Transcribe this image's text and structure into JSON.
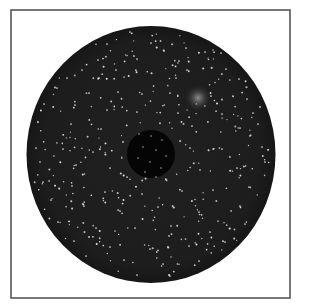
{
  "figure": {
    "width": 303,
    "height": 305,
    "background": "#ffffff",
    "frame": {
      "x": 11,
      "y": 10,
      "w": 279,
      "h": 288,
      "stroke": "#555555",
      "stroke_width": 1.6
    },
    "disc": {
      "cx": 151,
      "cy": 154.5,
      "rx": 124.5,
      "ry": 128.5,
      "fill": "#1d1d1d",
      "edge": "#161616"
    },
    "inner_hole": {
      "cx": 151,
      "cy": 154,
      "r": 24,
      "fill": "#050505"
    },
    "glow": {
      "cx": 198,
      "cy": 98,
      "r": 14,
      "color": "#d8d8d8",
      "opacity": 0.75
    },
    "stars": {
      "color": "#e8e8e8",
      "radius": 0.85,
      "seed": 7,
      "count": 330,
      "explicit": [
        [
          130,
          32
        ],
        [
          107,
          44
        ],
        [
          151,
          43
        ],
        [
          164,
          51
        ],
        [
          186,
          48
        ],
        [
          205,
          52
        ],
        [
          221,
          53
        ],
        [
          98,
          60
        ],
        [
          137,
          59
        ],
        [
          179,
          61
        ],
        [
          82,
          70
        ],
        [
          116,
          70
        ],
        [
          187,
          70
        ],
        [
          226,
          69
        ],
        [
          67,
          78
        ],
        [
          99,
          78
        ],
        [
          176,
          78
        ],
        [
          239,
          79
        ],
        [
          57,
          88
        ],
        [
          89,
          93
        ],
        [
          118,
          92
        ],
        [
          142,
          94
        ],
        [
          170,
          93
        ],
        [
          211,
          96
        ],
        [
          247,
          99
        ],
        [
          44,
          104
        ],
        [
          75,
          105
        ],
        [
          107,
          110
        ],
        [
          137,
          112
        ],
        [
          178,
          113
        ],
        [
          222,
          114
        ],
        [
          253,
          113
        ],
        [
          38,
          122
        ],
        [
          71,
          124
        ],
        [
          101,
          129
        ],
        [
          192,
          126
        ],
        [
          240,
          128
        ],
        [
          258,
          124
        ],
        [
          36,
          148
        ],
        [
          63,
          149
        ],
        [
          93,
          152
        ],
        [
          190,
          148
        ],
        [
          222,
          149
        ],
        [
          262,
          147
        ],
        [
          40,
          162
        ],
        [
          76,
          165
        ],
        [
          110,
          168
        ],
        [
          200,
          170
        ],
        [
          237,
          168
        ],
        [
          265,
          162
        ],
        [
          43,
          182
        ],
        [
          72,
          186
        ],
        [
          105,
          192
        ],
        [
          142,
          194
        ],
        [
          182,
          191
        ],
        [
          213,
          190
        ],
        [
          249,
          187
        ],
        [
          51,
          200
        ],
        [
          84,
          206
        ],
        [
          120,
          211
        ],
        [
          158,
          207
        ],
        [
          199,
          212
        ],
        [
          240,
          206
        ],
        [
          58,
          222
        ],
        [
          96,
          228
        ],
        [
          135,
          228
        ],
        [
          171,
          226
        ],
        [
          210,
          232
        ],
        [
          245,
          224
        ],
        [
          74,
          241
        ],
        [
          110,
          247
        ],
        [
          150,
          249
        ],
        [
          189,
          246
        ],
        [
          225,
          242
        ],
        [
          86,
          256
        ],
        [
          124,
          260
        ],
        [
          163,
          264
        ],
        [
          199,
          261
        ],
        [
          137,
          275
        ],
        [
          170,
          276
        ]
      ],
      "inside_hole": [
        [
          139,
          134
        ],
        [
          151,
          136
        ],
        [
          162,
          140
        ],
        [
          143,
          147
        ],
        [
          156,
          150
        ],
        [
          166,
          156
        ],
        [
          138,
          158
        ],
        [
          150,
          162
        ],
        [
          161,
          168
        ],
        [
          145,
          172
        ],
        [
          156,
          177
        ]
      ]
    }
  }
}
